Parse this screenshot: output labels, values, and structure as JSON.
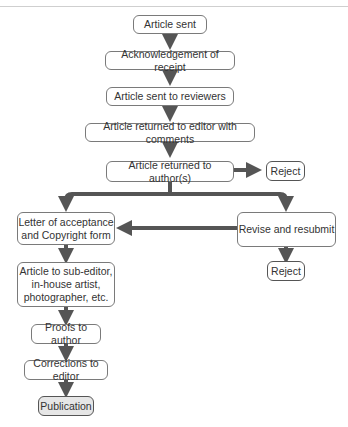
{
  "diagram": {
    "nodes": [
      {
        "id": "article-sent",
        "label": "Article sent"
      },
      {
        "id": "acknowledgement",
        "label": "Acknowledgement of receipt"
      },
      {
        "id": "sent-to-reviewers",
        "label": "Article sent to reviewers"
      },
      {
        "id": "returned-to-editor",
        "label": "Article returned to editor with comments"
      },
      {
        "id": "returned-to-author",
        "label": "Article returned to author(s)"
      },
      {
        "id": "reject-1",
        "label": "Reject"
      },
      {
        "id": "letter-of-acceptance",
        "label": "Letter of acceptance\nand Copyright form"
      },
      {
        "id": "revise-resubmit",
        "label": "Revise and resubmit"
      },
      {
        "id": "reject-2",
        "label": "Reject"
      },
      {
        "id": "sub-editor",
        "label": "Article to sub-editor,\nin-house artist,\nphotographer, etc."
      },
      {
        "id": "proofs",
        "label": "Proofs to author"
      },
      {
        "id": "corrections",
        "label": "Corrections to editor"
      },
      {
        "id": "publication",
        "label": "Publication"
      }
    ],
    "edges": [
      [
        "article-sent",
        "acknowledgement"
      ],
      [
        "acknowledgement",
        "sent-to-reviewers"
      ],
      [
        "sent-to-reviewers",
        "returned-to-editor"
      ],
      [
        "returned-to-editor",
        "returned-to-author"
      ],
      [
        "returned-to-author",
        "reject-1"
      ],
      [
        "returned-to-author",
        "letter-of-acceptance"
      ],
      [
        "returned-to-author",
        "revise-resubmit"
      ],
      [
        "revise-resubmit",
        "letter-of-acceptance"
      ],
      [
        "revise-resubmit",
        "reject-2"
      ],
      [
        "letter-of-acceptance",
        "sub-editor"
      ],
      [
        "sub-editor",
        "proofs"
      ],
      [
        "proofs",
        "corrections"
      ],
      [
        "corrections",
        "publication"
      ]
    ],
    "colors": {
      "arrow": "#555555",
      "border": "#7a7a7a",
      "publication_fill": "#e6e6e6"
    }
  }
}
